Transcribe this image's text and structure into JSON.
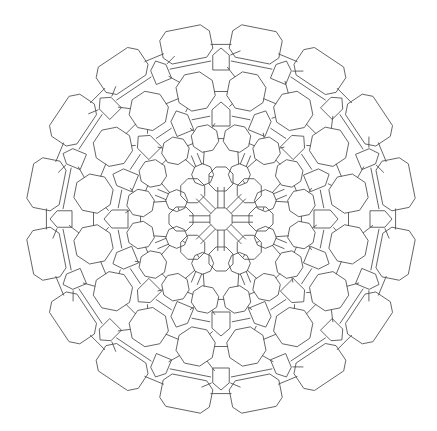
{
  "figure": {
    "width": 437,
    "height": 431,
    "background": "#ffffff",
    "stroke_color": "#4a4a4a",
    "stroke_width": 0.85,
    "center": [
      221,
      219
    ],
    "symmetry_order": 8,
    "outer_radius": 194
  },
  "pattern": {
    "central_octagon_radius": 12,
    "spoke_gap": 3.2,
    "rings": [
      {
        "name": "inner-octagons",
        "radius": 40,
        "count": 8,
        "cell": "octagon",
        "size": 13,
        "phase": 0
      },
      {
        "name": "inner-octagons-b",
        "radius": 48,
        "count": 8,
        "cell": "octagon",
        "size": 11,
        "phase": 22.5
      },
      {
        "name": "mid-octagons",
        "radius": 82,
        "count": 16,
        "cell": "octagon",
        "size": 14,
        "phase": 11.25
      },
      {
        "name": "mid-cells",
        "radius": 105,
        "count": 16,
        "cell": "pentagon",
        "size": 12,
        "phase": 0
      },
      {
        "name": "outer-octagons",
        "radius": 130,
        "count": 16,
        "cell": "octagon",
        "size": 20,
        "phase": 11.25
      },
      {
        "name": "outer-pentagons",
        "radius": 160,
        "count": 16,
        "cell": "pentagon",
        "size": 11,
        "phase": 0
      },
      {
        "name": "rim-lobes",
        "radius": 178,
        "count": 16,
        "cell": "lobe",
        "size": 22,
        "phase": 11.25
      }
    ]
  }
}
